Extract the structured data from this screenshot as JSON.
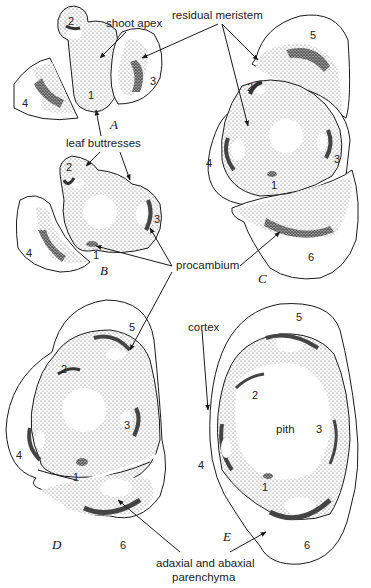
{
  "figure": {
    "panels": [
      "A",
      "B",
      "C",
      "D",
      "E"
    ],
    "labels": {
      "shoot_apex": "shoot apex",
      "residual_meristem": "residual meristem",
      "leaf_buttresses": "leaf buttresses",
      "procambium": "procambium",
      "cortex": "cortex",
      "pith": "pith",
      "parenchyma_line1": "adaxial and abaxial",
      "parenchyma_line2": "parenchyma"
    },
    "leaf_numbers": {
      "A": [
        "1",
        "2",
        "3",
        "4"
      ],
      "B": [
        "1",
        "2",
        "3",
        "4"
      ],
      "C": [
        "1",
        "2",
        "3",
        "4",
        "5",
        "6"
      ],
      "D": [
        "1",
        "2",
        "3",
        "4",
        "5",
        "6"
      ],
      "E": [
        "1",
        "2",
        "3",
        "4",
        "5",
        "6"
      ]
    },
    "colors": {
      "ink": "#1a1a1a",
      "stipple": "#8a8a8a",
      "dense_stipple": "#4a4a4a",
      "background": "#ffffff"
    }
  }
}
